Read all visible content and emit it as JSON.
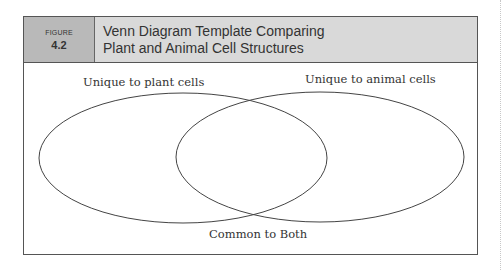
{
  "figure": {
    "label_word": "FIGURE",
    "number": "4.2",
    "title_line1": "Venn Diagram Template Comparing",
    "title_line2": "Plant and Animal Cell Structures"
  },
  "venn": {
    "left_set_label": "Unique to plant cells",
    "right_set_label": "Unique to animal cells",
    "intersection_label": "Common to Both",
    "stroke_color": "#444444",
    "header_label_bg": "#b9b9b9",
    "header_title_bg": "#d9d9d9"
  }
}
